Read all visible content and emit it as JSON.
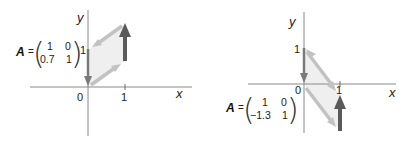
{
  "panels": [
    {
      "id": "left",
      "axis_labels": {
        "x": "x",
        "y": "y"
      },
      "ticks": {
        "origin": "0",
        "x1": "1",
        "y1": "1"
      },
      "matrix": {
        "name": "A",
        "equals": "=",
        "rows": [
          [
            "1",
            "0"
          ],
          [
            "0.7",
            "1"
          ]
        ]
      },
      "parallelogram": [
        [
          0,
          0
        ],
        [
          1,
          0.7
        ],
        [
          1,
          1.7
        ],
        [
          0,
          1
        ]
      ],
      "dark_arrows": [
        {
          "from": [
            0,
            1
          ],
          "to": [
            0,
            0
          ]
        },
        {
          "from": [
            1,
            0.7
          ],
          "to": [
            1,
            1.7
          ]
        }
      ]
    },
    {
      "id": "right",
      "axis_labels": {
        "x": "x",
        "y": "y"
      },
      "ticks": {
        "origin": "0",
        "x1": "1",
        "y1": "1"
      },
      "matrix": {
        "name": "A",
        "equals": "=",
        "rows": [
          [
            "1",
            "0"
          ],
          [
            "−1.3",
            "1"
          ]
        ]
      },
      "parallelogram": [
        [
          0,
          0
        ],
        [
          0,
          1
        ],
        [
          1,
          -0.3
        ],
        [
          1,
          -1.3
        ]
      ],
      "dark_arrows": [
        {
          "from": [
            0,
            1
          ],
          "to": [
            0,
            0
          ]
        },
        {
          "from": [
            1,
            -1.3
          ],
          "to": [
            1,
            -0.3
          ]
        }
      ]
    }
  ],
  "colors": {
    "axis": "#8a8a8a",
    "light_arrow": "#c2c2c2",
    "dark_arrow": "#5a5a5a",
    "fill": "#ebebeb"
  }
}
